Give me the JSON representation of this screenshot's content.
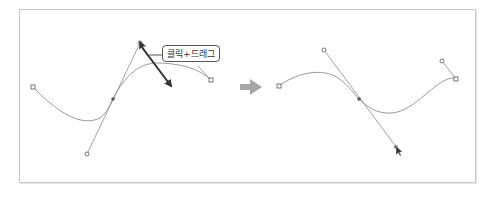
{
  "figure": {
    "callout_label": "클릭+드래그",
    "colors": {
      "frame_border": "#c8c8c8",
      "curve": "#9a9a9a",
      "handle_line": "#8a8a8a",
      "anchor_fill": "#555555",
      "drag_arrow": "#333333",
      "transition_arrow": "#a6a6a6",
      "label_border": "#555555"
    },
    "before": {
      "description": "Bezier curve with anchor handle being click-dragged",
      "start_point": [
        33,
        87
      ],
      "anchor_point": [
        113,
        99
      ],
      "handle_top": [
        140,
        43
      ],
      "handle_bottom": [
        87,
        154
      ],
      "end_point": [
        211,
        80
      ],
      "drag_arrow": {
        "from": [
          140,
          45
        ],
        "to": [
          172,
          88
        ]
      }
    },
    "transition_arrow": {
      "from": [
        240,
        87
      ],
      "to": [
        262,
        87
      ]
    },
    "after": {
      "description": "Resulting curve after dragging handle direction",
      "start_point": [
        279,
        86
      ],
      "anchor_point": [
        359,
        99
      ],
      "handle_top": [
        324,
        50
      ],
      "handle_bottom": [
        397,
        148
      ],
      "end_point": [
        456,
        79
      ],
      "end_handle": [
        442,
        61
      ]
    }
  }
}
